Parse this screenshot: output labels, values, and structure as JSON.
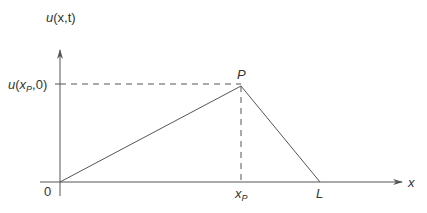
{
  "diagram": {
    "type": "piecewise-linear initial displacement (plucked string)",
    "colors": {
      "stroke": "#555555",
      "text": "#333333",
      "background": "#ffffff"
    },
    "axes": {
      "y_label": {
        "func": "u",
        "args": "(x,t)"
      },
      "x_label": "x",
      "origin_label": "0"
    },
    "points": {
      "peak_label": "P",
      "x_tick_label": {
        "base": "x",
        "sub": "P"
      },
      "y_tick_label": {
        "func": "u(",
        "base": "x",
        "sub": "P",
        "tail": ",0)"
      },
      "end_label": "L"
    }
  }
}
